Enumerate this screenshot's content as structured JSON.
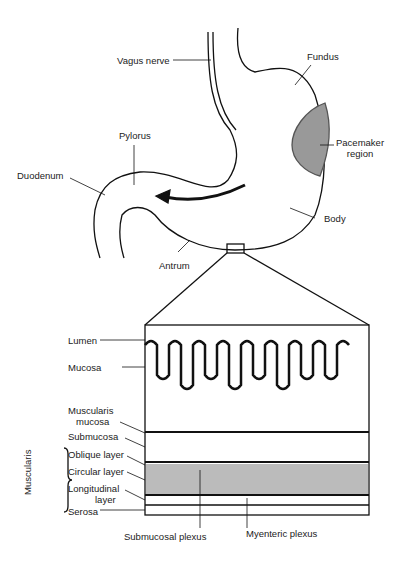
{
  "stomach_labels": {
    "vagus_nerve": "Vagus nerve",
    "fundus": "Fundus",
    "pylorus": "Pylorus",
    "pacemaker_1": "Pacemaker",
    "pacemaker_2": "region",
    "duodenum": "Duodenum",
    "body": "Body",
    "antrum": "Antrum"
  },
  "wall_labels": {
    "lumen": "Lumen",
    "mucosa": "Mucosa",
    "muscularis_mucosa_1": "Muscularis",
    "muscularis_mucosa_2": "mucosa",
    "submucosa": "Submucosa",
    "oblique": "Oblique layer",
    "circular": "Circular layer",
    "longitudinal_1": "Longitudinal",
    "longitudinal_2": "layer",
    "serosa": "Serosa",
    "muscularis_group": "Muscularis",
    "submucosal_plexus": "Submucosal plexus",
    "myenteric_plexus": "Myenteric plexus"
  }
}
